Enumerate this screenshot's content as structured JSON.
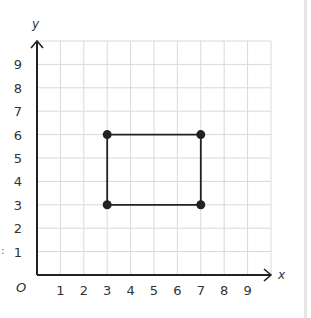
{
  "chart_data": {
    "type": "scatter",
    "title": "",
    "xlabel": "x",
    "ylabel": "y",
    "origin_label": "O",
    "xlim": [
      0,
      10
    ],
    "ylim": [
      0,
      10
    ],
    "x_ticks": [
      "1",
      "2",
      "3",
      "4",
      "5",
      "6",
      "7",
      "8",
      "9"
    ],
    "y_ticks": [
      "1",
      "2",
      "3",
      "4",
      "5",
      "6",
      "7",
      "8",
      "9"
    ],
    "grid": true,
    "legend": null,
    "points": [
      {
        "x": 3,
        "y": 6
      },
      {
        "x": 7,
        "y": 6
      },
      {
        "x": 7,
        "y": 3
      },
      {
        "x": 3,
        "y": 3
      }
    ],
    "polygon": {
      "shape": "rectangle",
      "closed": true,
      "vertices": [
        [
          3,
          6
        ],
        [
          7,
          6
        ],
        [
          7,
          3
        ],
        [
          3,
          3
        ]
      ]
    }
  },
  "colors": {
    "grid": "#d9d9d9",
    "axis": "#222222",
    "shape": "#222222",
    "labels": "#333333",
    "right_strip": "#e6e6e6"
  },
  "stray_mark": ":"
}
